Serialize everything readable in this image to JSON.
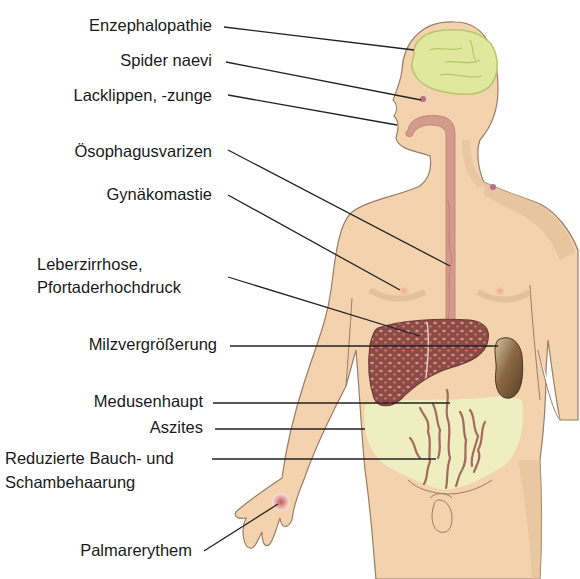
{
  "colors": {
    "skin": "#f2d3ad",
    "skin_shadow": "#e3bf98",
    "outline": "#9a7d66",
    "brain": "#dfe89c",
    "brain_outline": "#b6c66a",
    "esophagus": "#d59b8a",
    "liver": "#8f4a45",
    "liver_spots": "#c49088",
    "spleen": "#6a4a2c",
    "abdomen": "#eef1c4",
    "veins": "#a46b5a",
    "leader_line": "#222222",
    "text": "#1a1a1a"
  },
  "labels": [
    {
      "id": "encephalopathy",
      "text": "Enzephalopathie"
    },
    {
      "id": "spider-naevi",
      "text": "Spider naevi"
    },
    {
      "id": "lacquer-lips",
      "text": "Lacklippen, -zunge"
    },
    {
      "id": "esophageal-varices",
      "text": "Ösophagusvarizen"
    },
    {
      "id": "gynecomastia",
      "text": "Gynäkomastie"
    },
    {
      "id": "liver-cirrhosis-line1",
      "text": "Leberzirrhose,"
    },
    {
      "id": "liver-cirrhosis-line2",
      "text": "Pfortaderhochdruck"
    },
    {
      "id": "splenomegaly",
      "text": "Milzvergrößerung"
    },
    {
      "id": "caput-medusae",
      "text": "Medusenhaupt"
    },
    {
      "id": "ascites",
      "text": "Aszites"
    },
    {
      "id": "reduced-hair-line1",
      "text": "Reduzierte Bauch- und"
    },
    {
      "id": "reduced-hair-line2",
      "text": "Schambehaarung"
    },
    {
      "id": "palmar-erythema",
      "text": "Palmarerythem"
    }
  ]
}
